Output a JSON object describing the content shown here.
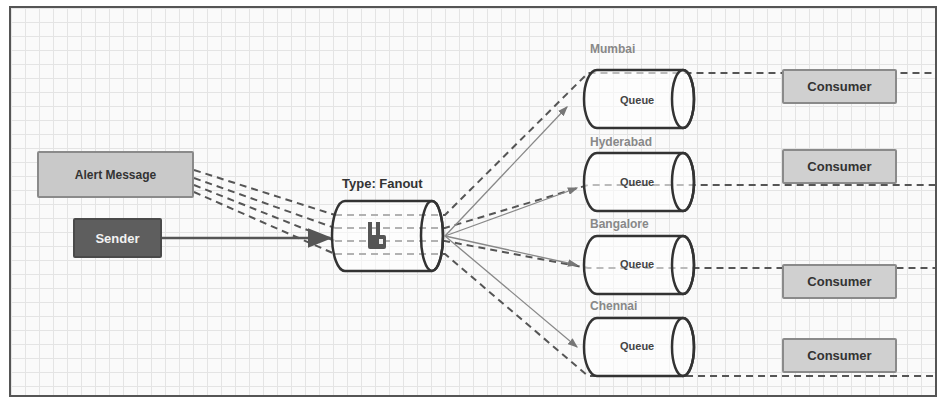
{
  "diagram": {
    "producer": {
      "message_label": "Alert Message",
      "sender_label": "Sender"
    },
    "exchange": {
      "type_label": "Type: Fanout",
      "icon": "rabbitmq-logo-icon"
    },
    "queues": [
      {
        "name": "Mumbai",
        "label": "Queue",
        "consumer": "Consumer"
      },
      {
        "name": "Hyderabad",
        "label": "Queue",
        "consumer": "Consumer"
      },
      {
        "name": "Bangalore",
        "label": "Queue",
        "consumer": "Consumer"
      },
      {
        "name": "Chennai",
        "label": "Queue",
        "consumer": "Consumer"
      }
    ],
    "colors": {
      "sender_fill": "#5e5e5e",
      "message_fill": "#c9c9c9",
      "consumer_fill": "#d0d0d0",
      "queue_label": "#888888",
      "line": "#555555"
    }
  }
}
